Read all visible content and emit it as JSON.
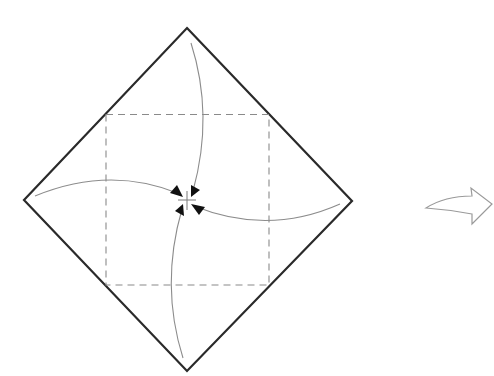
{
  "diagram": {
    "type": "origami-fold-step",
    "colors": {
      "background": "#ffffff",
      "outline": "#2a2a2a",
      "dashed": "#8a8a8a",
      "curve": "#8c8c8c",
      "arrowhead": "#111111",
      "next_arrow": "#9a9a9a"
    },
    "paper": {
      "shape": "diamond",
      "vertices": {
        "top": [
          187,
          28
        ],
        "right": [
          352,
          201
        ],
        "bottom": [
          187,
          371
        ],
        "left": [
          24,
          200
        ]
      }
    },
    "fold_guide": {
      "style": "dashed",
      "corners": {
        "top_left": [
          106,
          114
        ],
        "top_right": [
          269,
          115
        ],
        "bottom_right": [
          269,
          285
        ],
        "bottom_left": [
          106,
          285
        ]
      }
    },
    "center_mark": [
      187,
      200
    ],
    "fold_arrows": [
      {
        "name": "top-corner-to-center",
        "from": [
          191,
          43
        ],
        "to": [
          192,
          192
        ]
      },
      {
        "name": "left-corner-to-center",
        "from": [
          35,
          196
        ],
        "to": [
          181,
          195
        ]
      },
      {
        "name": "right-corner-to-center",
        "from": [
          340,
          204
        ],
        "to": [
          193,
          206
        ]
      },
      {
        "name": "bottom-corner-to-center",
        "from": [
          183,
          358
        ],
        "to": [
          182,
          208
        ]
      }
    ],
    "next_step_arrow": {
      "direction": "right",
      "label": "next-step"
    }
  }
}
